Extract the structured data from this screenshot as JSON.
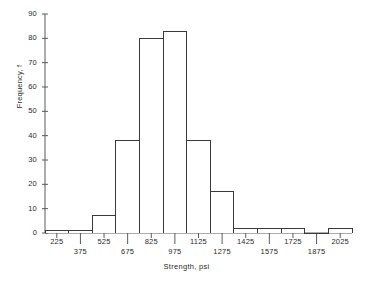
{
  "chart_data": {
    "type": "bar",
    "title": "",
    "xlabel": "Strength, psi",
    "ylabel": "Frequency, f",
    "bin_width": 150,
    "bin_edges": [
      150,
      300,
      450,
      600,
      750,
      900,
      1050,
      1200,
      1350,
      1500,
      1650,
      1800,
      1950,
      2100
    ],
    "categories": [
      "225",
      "375",
      "525",
      "675",
      "825",
      "975",
      "1125",
      "1275",
      "1425",
      "1575",
      "1725",
      "1875",
      "2025"
    ],
    "values": [
      1,
      1,
      7,
      38,
      80,
      83,
      38,
      17,
      2,
      2,
      2,
      0,
      2
    ],
    "xlim": [
      150,
      2100
    ],
    "ylim": [
      0,
      90
    ],
    "yticks": [
      0,
      10,
      20,
      30,
      40,
      50,
      60,
      70,
      80,
      90
    ],
    "ytick_labels": [
      "0",
      "10",
      "20",
      "30",
      "40",
      "50",
      "60",
      "70",
      "80",
      "90"
    ],
    "xticks": [
      225,
      375,
      525,
      675,
      825,
      975,
      1125,
      1275,
      1425,
      1575,
      1725,
      1875,
      2025
    ],
    "xtick_labels": [
      "225",
      "375",
      "525",
      "675",
      "825",
      "975",
      "1125",
      "1275",
      "1425",
      "1575",
      "1725",
      "1875",
      "2025"
    ],
    "grid": false,
    "legend": false,
    "line_color": "#3a3a3a",
    "fill_color": "#ffffff",
    "axis_color": "#5a5a5a"
  }
}
